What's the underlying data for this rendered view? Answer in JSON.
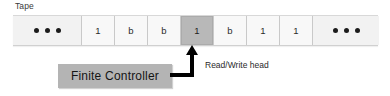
{
  "diagram": {
    "type": "turing-machine",
    "tape": {
      "label": "Tape",
      "cells": [
        {
          "kind": "ellipsis",
          "symbol": "• • •",
          "head": false
        },
        {
          "kind": "symbol",
          "symbol": "1",
          "head": false
        },
        {
          "kind": "symbol",
          "symbol": "b",
          "head": false
        },
        {
          "kind": "symbol",
          "symbol": "b",
          "head": false
        },
        {
          "kind": "symbol",
          "symbol": "1",
          "head": true
        },
        {
          "kind": "symbol",
          "symbol": "b",
          "head": false
        },
        {
          "kind": "symbol",
          "symbol": "1",
          "head": false
        },
        {
          "kind": "symbol",
          "symbol": "1",
          "head": false
        },
        {
          "kind": "ellipsis",
          "symbol": "• • •",
          "head": false
        }
      ],
      "head_cell_index": 4,
      "head_symbol": "1"
    },
    "controller": {
      "label": "Finite  Controller"
    },
    "head_annotation": {
      "label": "Read/Write head"
    },
    "connector": {
      "icon_name": "elbow-arrow-up"
    },
    "colors": {
      "tape_cell_background": "#f7f7f7",
      "head_cell_background": "#b8b8b8",
      "controller_background": "#b4b4b4",
      "connector": "#000000",
      "text": "#2b2b2b",
      "page_background": "#ffffff"
    }
  }
}
